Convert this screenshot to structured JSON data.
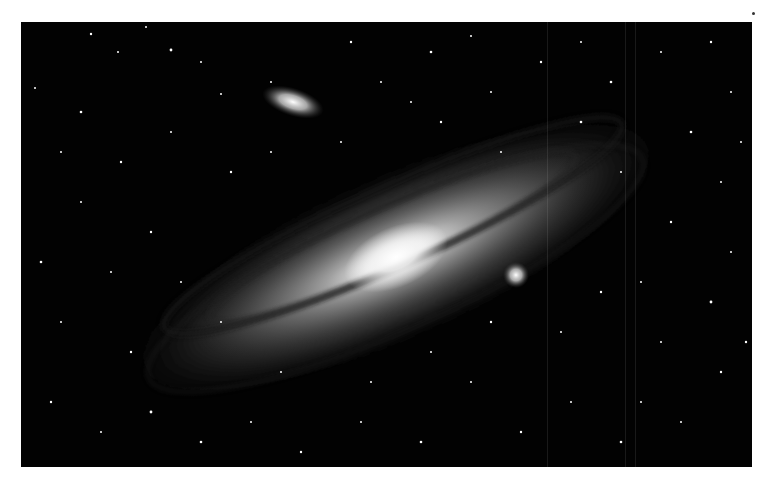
{
  "image": {
    "subject": "Andromeda Galaxy (M31) with satellite galaxies M32 and M110",
    "style": "black-and-white astrophotograph",
    "background_color": "#ffffff",
    "sky_color": "#020202"
  }
}
